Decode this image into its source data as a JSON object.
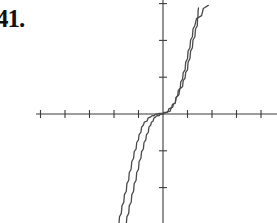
{
  "problem": {
    "label": "41."
  },
  "chart_data": {
    "type": "line",
    "title": "",
    "xlabel": "",
    "ylabel": "",
    "grid": false,
    "legend": null,
    "origin_px": [
      163,
      114
    ],
    "x_tick_spacing_px": 24.5,
    "y_tick_spacing_px": 36.8,
    "x_ticks": [
      -5,
      -4,
      -3,
      -2,
      -1,
      1,
      2,
      3,
      4
    ],
    "y_ticks": [
      -2,
      -1,
      1,
      2,
      3
    ],
    "xlim": [
      -5.2,
      4.8
    ],
    "ylim": [
      -3,
      3.1
    ],
    "series": [
      {
        "name": "curve-a",
        "description": "staircase-like cubic curve (outer branch in upper half)",
        "points": [
          [
            -1.5,
            -3.0
          ],
          [
            -1.3,
            -2.4
          ],
          [
            -1.1,
            -1.8
          ],
          [
            -0.9,
            -1.2
          ],
          [
            -0.7,
            -0.7
          ],
          [
            -0.5,
            -0.3
          ],
          [
            -0.3,
            -0.08
          ],
          [
            0,
            0
          ],
          [
            0.3,
            0.08
          ],
          [
            0.5,
            0.3
          ],
          [
            0.7,
            0.7
          ],
          [
            0.9,
            1.2
          ],
          [
            1.1,
            1.8
          ],
          [
            1.3,
            2.4
          ],
          [
            1.85,
            2.95
          ]
        ]
      },
      {
        "name": "curve-b",
        "description": "staircase-like cubic curve (inner branch in upper half)",
        "points": [
          [
            -1.8,
            -3.0
          ],
          [
            -1.6,
            -2.4
          ],
          [
            -1.4,
            -1.8
          ],
          [
            -1.2,
            -1.2
          ],
          [
            -1.0,
            -0.7
          ],
          [
            -0.8,
            -0.3
          ],
          [
            -0.5,
            -0.08
          ],
          [
            -0.2,
            0
          ],
          [
            0.2,
            0.05
          ],
          [
            0.5,
            0.3
          ],
          [
            0.8,
            0.75
          ],
          [
            1.0,
            1.2
          ],
          [
            1.2,
            1.8
          ],
          [
            1.4,
            2.4
          ],
          [
            1.45,
            2.88
          ]
        ]
      }
    ]
  }
}
